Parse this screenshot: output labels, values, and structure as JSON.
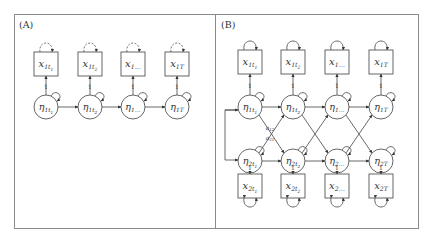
{
  "panels": [
    {
      "id": "A",
      "label": "(A)",
      "observed": [
        {
          "main": "x",
          "sub": "1t",
          "subsub": "1"
        },
        {
          "main": "x",
          "sub": "1t",
          "subsub": "2"
        },
        {
          "main": "x",
          "sub": "1…",
          "subsub": ""
        },
        {
          "main": "x",
          "sub": "1T",
          "subsub": ""
        }
      ],
      "latent": [
        {
          "main": "η",
          "sub": "1t",
          "subsub": "1"
        },
        {
          "main": "η",
          "sub": "1t",
          "subsub": "2"
        },
        {
          "main": "η",
          "sub": "1…",
          "subsub": ""
        },
        {
          "main": "η",
          "sub": "1T",
          "subsub": ""
        }
      ],
      "loading_label": "1",
      "residual_style": "dashed"
    },
    {
      "id": "B",
      "label": "(B)",
      "observed_top": [
        {
          "main": "x",
          "sub": "1t",
          "subsub": "1"
        },
        {
          "main": "x",
          "sub": "1t",
          "subsub": "2"
        },
        {
          "main": "x",
          "sub": "1…",
          "subsub": ""
        },
        {
          "main": "x",
          "sub": "1T",
          "subsub": ""
        }
      ],
      "latent_top": [
        {
          "main": "η",
          "sub": "1t",
          "subsub": "1"
        },
        {
          "main": "η",
          "sub": "1t",
          "subsub": "2"
        },
        {
          "main": "η",
          "sub": "1…",
          "subsub": ""
        },
        {
          "main": "η",
          "sub": "1T",
          "subsub": ""
        }
      ],
      "latent_bottom": [
        {
          "main": "η",
          "sub": "2t",
          "subsub": "1"
        },
        {
          "main": "η",
          "sub": "2t",
          "subsub": "2"
        },
        {
          "main": "η",
          "sub": "2…",
          "subsub": ""
        },
        {
          "main": "η",
          "sub": "2T",
          "subsub": ""
        }
      ],
      "observed_bottom": [
        {
          "main": "x",
          "sub": "2t",
          "subsub": "1"
        },
        {
          "main": "x",
          "sub": "2t",
          "subsub": "2"
        },
        {
          "main": "x",
          "sub": "2…",
          "subsub": ""
        },
        {
          "main": "x",
          "sub": "2T",
          "subsub": ""
        }
      ],
      "loading_label": "1",
      "cross_lag_labels": [
        "a12",
        "a21"
      ],
      "residual_style": "solid"
    }
  ]
}
